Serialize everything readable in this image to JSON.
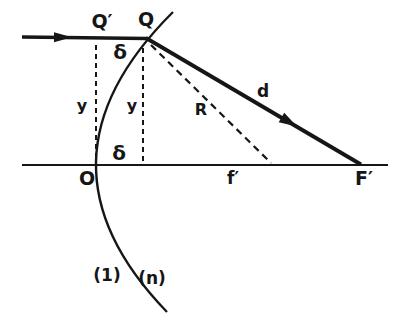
{
  "palette": {
    "background": "#ffffff",
    "ink": "#161616"
  },
  "figure": {
    "type": "optics-refraction-ray-diagram",
    "labels": {
      "q_prime": "Q′",
      "q": "Q",
      "delta_upper": "δ",
      "y_left": "y",
      "y_right": "y",
      "radius": "R",
      "ray_distance": "d",
      "delta_lower": "δ",
      "vertex": "O",
      "focal_distance": "f′",
      "focal_point": "F′",
      "medium_left": "(1)",
      "medium_right": "(n)"
    }
  }
}
